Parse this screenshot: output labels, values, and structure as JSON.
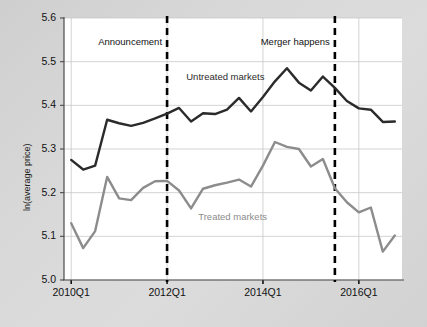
{
  "chart_data": {
    "type": "line",
    "title": "",
    "xlabel": "",
    "ylabel": "ln(average price)",
    "ylim": [
      5.0,
      5.6
    ],
    "yticks": [
      "5.0",
      "5.1",
      "5.2",
      "5.3",
      "5.4",
      "5.5",
      "5.6"
    ],
    "xticks": [
      "2010Q1",
      "2012Q1",
      "2014Q1",
      "2016Q1"
    ],
    "xtick_values": [
      0,
      8,
      16,
      24
    ],
    "grid": true,
    "legend_position": "inline-annotations",
    "x": [
      0,
      1,
      2,
      3,
      4,
      5,
      6,
      7,
      8,
      9,
      10,
      11,
      12,
      13,
      14,
      15,
      16,
      17,
      18,
      19,
      20,
      21,
      22,
      23,
      24,
      25,
      26,
      27
    ],
    "x_quarters": [
      "2010Q1",
      "2010Q2",
      "2010Q3",
      "2010Q4",
      "2011Q1",
      "2011Q2",
      "2011Q3",
      "2011Q4",
      "2012Q1",
      "2012Q2",
      "2012Q3",
      "2012Q4",
      "2013Q1",
      "2013Q2",
      "2013Q3",
      "2013Q4",
      "2014Q1",
      "2014Q2",
      "2014Q3",
      "2014Q4",
      "2015Q1",
      "2015Q2",
      "2015Q3",
      "2015Q4",
      "2016Q1",
      "2016Q2",
      "2016Q3",
      "2016Q4"
    ],
    "series": [
      {
        "name": "Untreated markets",
        "color": "#2b2b2b",
        "values": [
          5.275,
          5.253,
          5.262,
          5.367,
          5.359,
          5.353,
          5.36,
          5.37,
          5.381,
          5.394,
          5.363,
          5.382,
          5.38,
          5.39,
          5.417,
          5.386,
          5.419,
          5.455,
          5.485,
          5.452,
          5.434,
          5.466,
          5.44,
          5.41,
          5.393,
          5.39,
          5.362,
          5.363
        ]
      },
      {
        "name": "Treated markets",
        "color": "#8c8c8c",
        "values": [
          5.13,
          5.073,
          5.112,
          5.236,
          5.187,
          5.183,
          5.211,
          5.226,
          5.227,
          5.205,
          5.164,
          5.209,
          5.217,
          5.223,
          5.23,
          5.214,
          5.262,
          5.316,
          5.305,
          5.3,
          5.26,
          5.277,
          5.21,
          5.178,
          5.155,
          5.166,
          5.065,
          5.102
        ]
      }
    ],
    "annotations": [
      {
        "label": "Announcement",
        "x_value": 8,
        "x_quarter": "2012Q1",
        "style": "dashed-vline",
        "color": "#000000"
      },
      {
        "label": "Merger happens",
        "x_value": 22,
        "x_quarter": "2015Q3",
        "style": "dashed-vline",
        "color": "#000000"
      }
    ],
    "series_labels": [
      {
        "text": "Untreated markets",
        "x_value": 9.6,
        "y_value": 5.462,
        "color": "#2b2b2b"
      },
      {
        "text": "Treated markets",
        "x_value": 10.6,
        "y_value": 5.142,
        "color": "#8c8c8c"
      }
    ]
  },
  "colors": {
    "background": "#d6d6d6",
    "plot_background": "#ffffff",
    "grid": "#c8c8c8",
    "axis": "#4a4a4a",
    "untreated": "#2b2b2b",
    "treated": "#8c8c8c"
  }
}
